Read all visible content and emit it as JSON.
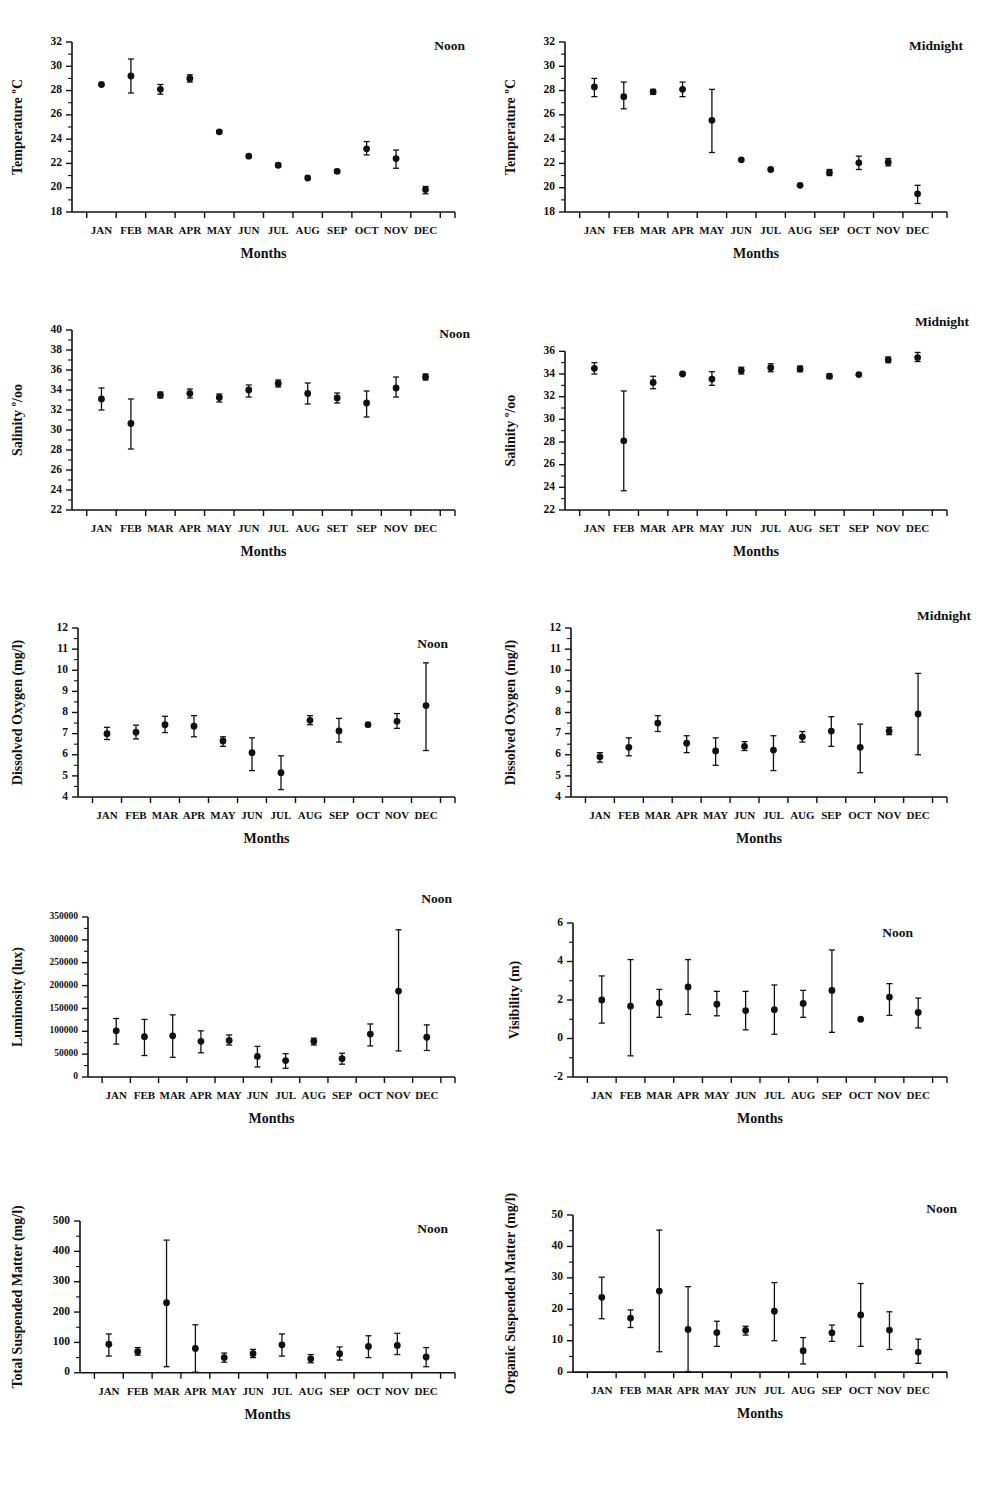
{
  "figure": {
    "months": [
      "JAN",
      "FEB",
      "MAR",
      "APR",
      "MAY",
      "JUN",
      "JUL",
      "AUG",
      "SEP",
      "OCT",
      "NOV",
      "DEC"
    ],
    "months_salinity": [
      "JAN",
      "FEB",
      "MAR",
      "APR",
      "MAY",
      "JUN",
      "JUL",
      "AUG",
      "SET",
      "SEP",
      "NOV",
      "DEC"
    ],
    "xlabel": "Months",
    "tag_noon": "Noon",
    "tag_midnight": "Midnight"
  },
  "chart_data": [
    {
      "id": "temperature-noon",
      "type": "scatter",
      "title": "Noon",
      "ylabel": "Temperature ºC",
      "xlabel": "Months",
      "ylim": [
        18,
        32
      ],
      "yticks": [
        18,
        20,
        22,
        24,
        26,
        28,
        30,
        32
      ],
      "ytick_labels": [
        "18",
        "20",
        "22",
        "24",
        "26",
        "28",
        "30",
        "32"
      ],
      "grid": false,
      "categories": [
        "JAN",
        "FEB",
        "MAR",
        "APR",
        "MAY",
        "JUN",
        "JUL",
        "AUG",
        "SEP",
        "OCT",
        "NOV",
        "DEC"
      ],
      "values": [
        28.5,
        29.2,
        28.1,
        29.0,
        24.6,
        22.6,
        21.85,
        20.8,
        21.35,
        23.2,
        22.4,
        19.85
      ],
      "err_low": [
        28.5,
        27.8,
        27.7,
        28.7,
        24.5,
        22.6,
        21.7,
        20.8,
        21.2,
        22.7,
        21.6,
        19.5
      ],
      "err_high": [
        28.5,
        30.6,
        28.5,
        29.3,
        24.7,
        22.6,
        22.0,
        20.8,
        21.5,
        23.8,
        23.1,
        20.1
      ]
    },
    {
      "id": "temperature-midnight",
      "type": "scatter",
      "title": "Midnight",
      "ylabel": "Temperature ºC",
      "xlabel": "Months",
      "ylim": [
        18,
        32
      ],
      "yticks": [
        18,
        20,
        22,
        24,
        26,
        28,
        30,
        32
      ],
      "ytick_labels": [
        "18",
        "20",
        "22",
        "24",
        "26",
        "28",
        "30",
        "32"
      ],
      "grid": false,
      "categories": [
        "JAN",
        "FEB",
        "MAR",
        "APR",
        "MAY",
        "JUN",
        "JUL",
        "AUG",
        "SEP",
        "OCT",
        "NOV",
        "DEC"
      ],
      "values": [
        28.3,
        27.5,
        27.9,
        28.1,
        25.55,
        22.3,
        21.5,
        20.2,
        21.25,
        22.05,
        22.1,
        19.5
      ],
      "err_low": [
        27.5,
        26.5,
        27.7,
        27.5,
        22.9,
        22.3,
        21.5,
        20.2,
        21.0,
        21.5,
        21.8,
        18.7
      ],
      "err_high": [
        29.0,
        28.7,
        28.1,
        28.7,
        28.1,
        22.3,
        21.5,
        20.2,
        21.5,
        22.6,
        22.4,
        20.2
      ]
    },
    {
      "id": "salinity-noon",
      "type": "scatter",
      "title": "Noon",
      "ylabel": "Salinity º/oo",
      "xlabel": "Months",
      "ylim": [
        22,
        40
      ],
      "yticks": [
        22,
        24,
        26,
        28,
        30,
        32,
        34,
        36,
        38,
        40
      ],
      "ytick_labels": [
        "22",
        "24",
        "26",
        "28",
        "30",
        "32",
        "34",
        "36",
        "38",
        "40"
      ],
      "grid": false,
      "categories": [
        "JAN",
        "FEB",
        "MAR",
        "APR",
        "MAY",
        "JUN",
        "JUL",
        "AUG",
        "SET",
        "SEP",
        "NOV",
        "DEC"
      ],
      "values": [
        33.1,
        30.65,
        33.5,
        33.65,
        33.25,
        34.0,
        34.65,
        33.65,
        33.2,
        32.7,
        34.2,
        35.3
      ],
      "err_low": [
        32.0,
        28.1,
        33.2,
        33.2,
        32.8,
        33.3,
        34.3,
        32.6,
        32.7,
        31.3,
        33.3,
        35.0
      ],
      "err_high": [
        34.2,
        33.1,
        33.8,
        34.1,
        33.6,
        34.5,
        35.0,
        34.7,
        33.7,
        33.9,
        35.3,
        35.6
      ]
    },
    {
      "id": "salinity-midnight",
      "type": "scatter",
      "title": "Midnight",
      "ylabel": "Salinity º/oo",
      "xlabel": "Months",
      "ylim": [
        22,
        37
      ],
      "yticks": [
        22,
        24,
        26,
        28,
        30,
        32,
        34,
        36
      ],
      "ytick_labels": [
        "22",
        "24",
        "26",
        "28",
        "30",
        "32",
        "34",
        "36"
      ],
      "grid": false,
      "categories": [
        "JAN",
        "FEB",
        "MAR",
        "APR",
        "MAY",
        "JUN",
        "JUL",
        "AUG",
        "SET",
        "SEP",
        "NOV",
        "DEC"
      ],
      "values": [
        34.5,
        28.1,
        33.25,
        34.0,
        33.55,
        34.3,
        34.55,
        34.45,
        33.8,
        33.95,
        35.25,
        35.45
      ],
      "err_low": [
        34.0,
        23.7,
        32.7,
        33.9,
        33.0,
        34.0,
        34.2,
        34.2,
        33.6,
        33.9,
        35.0,
        35.1
      ],
      "err_high": [
        35.0,
        32.5,
        33.8,
        34.1,
        34.2,
        34.6,
        34.9,
        34.7,
        34.0,
        34.0,
        35.5,
        35.9
      ]
    },
    {
      "id": "dissolved-oxygen-noon",
      "type": "scatter",
      "title": "Noon",
      "ylabel": "Dissolved Oxygen (mg/l)",
      "xlabel": "Months",
      "ylim": [
        4,
        12
      ],
      "yticks": [
        4,
        5,
        6,
        7,
        8,
        9,
        10,
        11,
        12
      ],
      "ytick_labels": [
        "4",
        "5",
        "6",
        "7",
        "8",
        "9",
        "10",
        "11",
        "12"
      ],
      "grid": false,
      "categories": [
        "JAN",
        "FEB",
        "MAR",
        "APR",
        "MAY",
        "JUN",
        "JUL",
        "AUG",
        "SEP",
        "OCT",
        "NOV",
        "DEC"
      ],
      "values": [
        7.0,
        7.07,
        7.42,
        7.35,
        6.65,
        6.1,
        5.15,
        7.63,
        7.13,
        7.43,
        7.58,
        8.33
      ],
      "err_low": [
        6.72,
        6.75,
        7.05,
        6.85,
        6.4,
        5.25,
        4.35,
        7.42,
        6.6,
        7.33,
        7.25,
        6.2
      ],
      "err_high": [
        7.3,
        7.4,
        7.82,
        7.85,
        6.85,
        6.8,
        5.95,
        7.85,
        7.72,
        7.5,
        7.95,
        10.35
      ]
    },
    {
      "id": "dissolved-oxygen-midnight",
      "type": "scatter",
      "title": "Midnight",
      "ylabel": "Dissolved Oxygen (mg/l)",
      "xlabel": "Months",
      "ylim": [
        4,
        12
      ],
      "yticks": [
        4,
        5,
        6,
        7,
        8,
        9,
        10,
        11,
        12
      ],
      "ytick_labels": [
        "4",
        "5",
        "6",
        "7",
        "8",
        "9",
        "10",
        "11",
        "12"
      ],
      "grid": false,
      "categories": [
        "JAN",
        "FEB",
        "MAR",
        "APR",
        "MAY",
        "JUN",
        "JUL",
        "AUG",
        "SEP",
        "OCT",
        "NOV",
        "DEC"
      ],
      "values": [
        5.9,
        6.35,
        7.5,
        6.55,
        6.18,
        6.4,
        6.22,
        6.85,
        7.12,
        6.35,
        7.12,
        7.93
      ],
      "err_low": [
        5.65,
        5.95,
        7.1,
        6.1,
        5.5,
        6.2,
        5.25,
        6.6,
        6.4,
        5.15,
        6.95,
        6.0
      ],
      "err_high": [
        6.1,
        6.8,
        7.85,
        6.9,
        6.8,
        6.62,
        6.9,
        7.1,
        7.8,
        7.45,
        7.3,
        9.85
      ]
    },
    {
      "id": "luminosity-noon",
      "type": "scatter",
      "title": "Noon",
      "ylabel": "Luminosity (lux)",
      "xlabel": "Months",
      "ylim": [
        0,
        350000
      ],
      "yticks": [
        0,
        50000,
        100000,
        150000,
        200000,
        250000,
        300000,
        350000
      ],
      "ytick_labels": [
        "0",
        "50000",
        "100000",
        "150000",
        "200000",
        "250000",
        "300000",
        "350000"
      ],
      "grid": false,
      "categories": [
        "JAN",
        "FEB",
        "MAR",
        "APR",
        "MAY",
        "JUN",
        "JUL",
        "AUG",
        "SEP",
        "OCT",
        "NOV",
        "DEC"
      ],
      "values": [
        101000,
        88000,
        90000,
        78000,
        80000,
        45000,
        36000,
        78000,
        40000,
        94000,
        188000,
        87000
      ],
      "err_low": [
        72000,
        47000,
        43000,
        53000,
        70000,
        22000,
        19000,
        70000,
        28000,
        68000,
        57000,
        58000
      ],
      "err_high": [
        128000,
        126000,
        136000,
        101000,
        92000,
        67000,
        51000,
        85000,
        52000,
        116000,
        322000,
        114000
      ]
    },
    {
      "id": "visibility-noon",
      "type": "scatter",
      "title": "Noon",
      "ylabel": "Visibility (m)",
      "xlabel": "Months",
      "ylim": [
        -2,
        6
      ],
      "yticks": [
        -2,
        0,
        2,
        4,
        6
      ],
      "ytick_labels": [
        "-2",
        "0",
        "2",
        "4",
        "6"
      ],
      "grid": false,
      "categories": [
        "JAN",
        "FEB",
        "MAR",
        "APR",
        "MAY",
        "JUN",
        "JUL",
        "AUG",
        "SEP",
        "OCT",
        "NOV",
        "DEC"
      ],
      "values": [
        2.0,
        1.68,
        1.85,
        2.68,
        1.78,
        1.45,
        1.5,
        1.82,
        2.5,
        1.0,
        2.15,
        1.35
      ],
      "err_low": [
        0.8,
        -0.9,
        1.1,
        1.25,
        1.18,
        0.45,
        0.22,
        1.1,
        0.32,
        1.0,
        1.2,
        0.55
      ],
      "err_high": [
        3.25,
        4.1,
        2.55,
        4.1,
        2.45,
        2.45,
        2.78,
        2.5,
        4.6,
        1.0,
        2.85,
        2.1
      ]
    },
    {
      "id": "total-suspended-matter-noon",
      "type": "scatter",
      "title": "Noon",
      "ylabel": "Total Suspended Matter (mg/l)",
      "xlabel": "Months",
      "ylim": [
        -60,
        500
      ],
      "yticks": [
        0,
        100,
        200,
        300,
        400,
        500
      ],
      "ytick_labels": [
        "0",
        "100",
        "200",
        "300",
        "400",
        "500"
      ],
      "grid": false,
      "categories": [
        "JAN",
        "FEB",
        "MAR",
        "APR",
        "MAY",
        "JUN",
        "JUL",
        "AUG",
        "SEP",
        "OCT",
        "NOV",
        "DEC"
      ],
      "values": [
        94,
        70,
        231,
        80,
        50,
        63,
        92,
        46,
        63,
        87,
        90,
        52
      ],
      "err_low": [
        55,
        58,
        20,
        2,
        35,
        50,
        55,
        33,
        42,
        50,
        60,
        20
      ],
      "err_high": [
        128,
        83,
        437,
        158,
        65,
        77,
        128,
        60,
        85,
        122,
        130,
        83
      ]
    },
    {
      "id": "organic-suspended-matter-noon",
      "type": "scatter",
      "title": "Noon",
      "ylabel": "Organic Suspended Matter (mg/l)",
      "xlabel": "Months",
      "ylim": [
        -6,
        50
      ],
      "yticks": [
        0,
        10,
        20,
        30,
        40,
        50
      ],
      "ytick_labels": [
        "0",
        "10",
        "20",
        "30",
        "40",
        "50"
      ],
      "grid": false,
      "categories": [
        "JAN",
        "FEB",
        "MAR",
        "APR",
        "MAY",
        "JUN",
        "JUL",
        "AUG",
        "SEP",
        "OCT",
        "NOV",
        "DEC"
      ],
      "values": [
        23.8,
        17.2,
        25.8,
        13.6,
        12.6,
        13.3,
        19.4,
        6.8,
        12.5,
        18.2,
        13.4,
        6.4
      ],
      "err_low": [
        17.0,
        14.2,
        6.5,
        0.2,
        8.2,
        11.8,
        10.0,
        2.6,
        9.8,
        8.2,
        7.2,
        2.8
      ],
      "err_high": [
        30.2,
        19.8,
        45.2,
        27.2,
        16.2,
        14.6,
        28.5,
        11.0,
        15.0,
        28.2,
        19.2,
        10.5
      ]
    }
  ]
}
